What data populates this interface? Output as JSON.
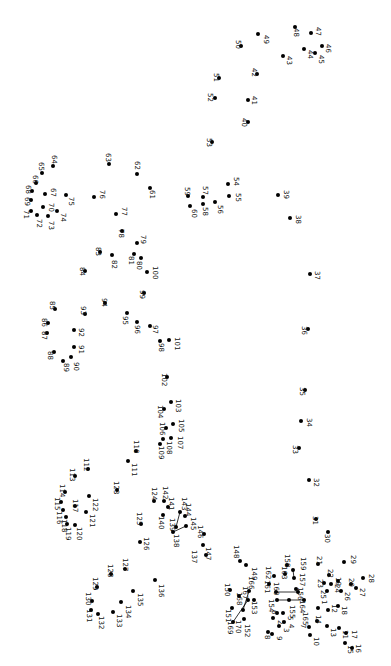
{
  "puzzle": {
    "type": "connect-the-dots",
    "orientation": "rotated-90-clockwise",
    "dot_color": "#000000",
    "label_color": "#111111",
    "background": "#ffffff",
    "total_points": 170,
    "points": [
      {
        "n": "1",
        "x": 318,
        "y": 608,
        "lx": 320,
        "ly": 600
      },
      {
        "n": "2",
        "x": 273,
        "y": 618,
        "lx": 276,
        "ly": 620
      },
      {
        "n": "3",
        "x": 279,
        "y": 626,
        "lx": 282,
        "ly": 628
      },
      {
        "n": "4",
        "x": 284,
        "y": 622,
        "lx": 287,
        "ly": 624
      },
      {
        "n": "5",
        "x": 283,
        "y": 613,
        "lx": 286,
        "ly": 616
      },
      {
        "n": "6",
        "x": 277,
        "y": 613,
        "lx": 270,
        "ly": 610
      },
      {
        "n": "7",
        "x": 309,
        "y": 627,
        "lx": 299,
        "ly": 624
      },
      {
        "n": "8",
        "x": 268,
        "y": 632,
        "lx": 263,
        "ly": 635
      },
      {
        "n": "9",
        "x": 272,
        "y": 634,
        "lx": 275,
        "ly": 636
      },
      {
        "n": "10",
        "x": 310,
        "y": 635,
        "lx": 312,
        "ly": 637
      },
      {
        "n": "11",
        "x": 339,
        "y": 628,
        "lx": 341,
        "ly": 630
      },
      {
        "n": "12",
        "x": 328,
        "y": 610,
        "lx": 330,
        "ly": 604
      },
      {
        "n": "13",
        "x": 327,
        "y": 626,
        "lx": 329,
        "ly": 628
      },
      {
        "n": "14",
        "x": 317,
        "y": 621,
        "lx": 314,
        "ly": 615
      },
      {
        "n": "15",
        "x": 345,
        "y": 643,
        "lx": 346,
        "ly": 645
      },
      {
        "n": "16",
        "x": 352,
        "y": 648,
        "lx": 354,
        "ly": 644
      },
      {
        "n": "17",
        "x": 346,
        "y": 633,
        "lx": 350,
        "ly": 630
      },
      {
        "n": "18",
        "x": 338,
        "y": 606,
        "lx": 340,
        "ly": 606
      },
      {
        "n": "19",
        "x": 338,
        "y": 581,
        "lx": 334,
        "ly": 577
      },
      {
        "n": "20",
        "x": 351,
        "y": 584,
        "lx": 347,
        "ly": 578
      },
      {
        "n": "21",
        "x": 318,
        "y": 564,
        "lx": 315,
        "ly": 556
      },
      {
        "n": "22",
        "x": 329,
        "y": 575,
        "lx": 326,
        "ly": 569
      },
      {
        "n": "23",
        "x": 324,
        "y": 583,
        "lx": 316,
        "ly": 579
      },
      {
        "n": "24",
        "x": 331,
        "y": 584,
        "lx": 333,
        "ly": 584
      },
      {
        "n": "25",
        "x": 327,
        "y": 591,
        "lx": 319,
        "ly": 590
      },
      {
        "n": "26",
        "x": 341,
        "y": 591,
        "lx": 343,
        "ly": 592
      },
      {
        "n": "27",
        "x": 356,
        "y": 588,
        "lx": 358,
        "ly": 588
      },
      {
        "n": "28",
        "x": 363,
        "y": 578,
        "lx": 367,
        "ly": 574
      },
      {
        "n": "29",
        "x": 344,
        "y": 562,
        "lx": 349,
        "ly": 555
      },
      {
        "n": "30",
        "x": 328,
        "y": 532,
        "lx": 323,
        "ly": 534
      },
      {
        "n": "31",
        "x": 316,
        "y": 519,
        "lx": 311,
        "ly": 516
      },
      {
        "n": "32",
        "x": 309,
        "y": 480,
        "lx": 312,
        "ly": 478
      },
      {
        "n": "33",
        "x": 299,
        "y": 448,
        "lx": 291,
        "ly": 445
      },
      {
        "n": "34",
        "x": 301,
        "y": 421,
        "lx": 305,
        "ly": 418
      },
      {
        "n": "35",
        "x": 305,
        "y": 390,
        "lx": 298,
        "ly": 387
      },
      {
        "n": "36",
        "x": 308,
        "y": 329,
        "lx": 300,
        "ly": 326
      },
      {
        "n": "37",
        "x": 310,
        "y": 274,
        "lx": 313,
        "ly": 271
      },
      {
        "n": "38",
        "x": 290,
        "y": 218,
        "lx": 294,
        "ly": 215
      },
      {
        "n": "39",
        "x": 278,
        "y": 195,
        "lx": 282,
        "ly": 190
      },
      {
        "n": "40",
        "x": 248,
        "y": 122,
        "lx": 240,
        "ly": 118
      },
      {
        "n": "41",
        "x": 248,
        "y": 100,
        "lx": 250,
        "ly": 96
      },
      {
        "n": "42",
        "x": 257,
        "y": 74,
        "lx": 250,
        "ly": 68
      },
      {
        "n": "43",
        "x": 283,
        "y": 56,
        "lx": 285,
        "ly": 56
      },
      {
        "n": "44",
        "x": 304,
        "y": 49,
        "lx": 306,
        "ly": 50
      },
      {
        "n": "45",
        "x": 315,
        "y": 53,
        "lx": 317,
        "ly": 55
      },
      {
        "n": "46",
        "x": 322,
        "y": 46,
        "lx": 324,
        "ly": 44
      },
      {
        "n": "47",
        "x": 311,
        "y": 33,
        "lx": 314,
        "ly": 27
      },
      {
        "n": "48",
        "x": 295,
        "y": 27,
        "lx": 292,
        "ly": 28
      },
      {
        "n": "49",
        "x": 258,
        "y": 34,
        "lx": 262,
        "ly": 35
      },
      {
        "n": "50",
        "x": 241,
        "y": 46,
        "lx": 234,
        "ly": 40
      },
      {
        "n": "51",
        "x": 219,
        "y": 78,
        "lx": 212,
        "ly": 73
      },
      {
        "n": "52",
        "x": 215,
        "y": 98,
        "lx": 206,
        "ly": 93
      },
      {
        "n": "53",
        "x": 212,
        "y": 142,
        "lx": 205,
        "ly": 138
      },
      {
        "n": "54",
        "x": 228,
        "y": 184,
        "lx": 232,
        "ly": 177
      },
      {
        "n": "55",
        "x": 229,
        "y": 196,
        "lx": 234,
        "ly": 193
      },
      {
        "n": "56",
        "x": 215,
        "y": 202,
        "lx": 216,
        "ly": 205
      },
      {
        "n": "57",
        "x": 203,
        "y": 197,
        "lx": 201,
        "ly": 186
      },
      {
        "n": "58",
        "x": 203,
        "y": 204,
        "lx": 201,
        "ly": 207
      },
      {
        "n": "59",
        "x": 188,
        "y": 196,
        "lx": 183,
        "ly": 187
      },
      {
        "n": "60",
        "x": 190,
        "y": 206,
        "lx": 190,
        "ly": 209
      },
      {
        "n": "61",
        "x": 150,
        "y": 188,
        "lx": 148,
        "ly": 190
      },
      {
        "n": "62",
        "x": 137,
        "y": 174,
        "lx": 133,
        "ly": 161
      },
      {
        "n": "63",
        "x": 109,
        "y": 164,
        "lx": 104,
        "ly": 153
      },
      {
        "n": "64",
        "x": 53,
        "y": 166,
        "lx": 50,
        "ly": 155
      },
      {
        "n": "65",
        "x": 42,
        "y": 173,
        "lx": 37,
        "ly": 162
      },
      {
        "n": "66",
        "x": 36,
        "y": 183,
        "lx": 31,
        "ly": 175
      },
      {
        "n": "67",
        "x": 45,
        "y": 194,
        "lx": 49,
        "ly": 188
      },
      {
        "n": "68",
        "x": 32,
        "y": 191,
        "lx": 24,
        "ly": 185
      },
      {
        "n": "69",
        "x": 31,
        "y": 200,
        "lx": 23,
        "ly": 197
      },
      {
        "n": "70",
        "x": 43,
        "y": 207,
        "lx": 47,
        "ly": 203
      },
      {
        "n": "71",
        "x": 31,
        "y": 211,
        "lx": 22,
        "ly": 210
      },
      {
        "n": "72",
        "x": 37,
        "y": 215,
        "lx": 35,
        "ly": 219
      },
      {
        "n": "73",
        "x": 48,
        "y": 216,
        "lx": 47,
        "ly": 221
      },
      {
        "n": "74",
        "x": 57,
        "y": 211,
        "lx": 59,
        "ly": 213
      },
      {
        "n": "75",
        "x": 66,
        "y": 195,
        "lx": 67,
        "ly": 197
      },
      {
        "n": "76",
        "x": 94,
        "y": 197,
        "lx": 98,
        "ly": 190
      },
      {
        "n": "77",
        "x": 116,
        "y": 214,
        "lx": 120,
        "ly": 207
      },
      {
        "n": "78",
        "x": 122,
        "y": 231,
        "lx": 117,
        "ly": 229
      },
      {
        "n": "79",
        "x": 137,
        "y": 243,
        "lx": 139,
        "ly": 235
      },
      {
        "n": "80",
        "x": 141,
        "y": 258,
        "lx": 135,
        "ly": 261
      },
      {
        "n": "81",
        "x": 134,
        "y": 254,
        "lx": 127,
        "ly": 256
      },
      {
        "n": "82",
        "x": 112,
        "y": 255,
        "lx": 110,
        "ly": 260
      },
      {
        "n": "83",
        "x": 100,
        "y": 252,
        "lx": 94,
        "ly": 247
      },
      {
        "n": "84",
        "x": 85,
        "y": 271,
        "lx": 78,
        "ly": 267
      },
      {
        "n": "85",
        "x": 55,
        "y": 309,
        "lx": 48,
        "ly": 301
      },
      {
        "n": "86",
        "x": 48,
        "y": 323,
        "lx": 40,
        "ly": 318
      },
      {
        "n": "87",
        "x": 47,
        "y": 333,
        "lx": 40,
        "ly": 331
      },
      {
        "n": "88",
        "x": 54,
        "y": 352,
        "lx": 46,
        "ly": 351
      },
      {
        "n": "89",
        "x": 63,
        "y": 361,
        "lx": 62,
        "ly": 363
      },
      {
        "n": "90",
        "x": 71,
        "y": 357,
        "lx": 72,
        "ly": 362
      },
      {
        "n": "91",
        "x": 74,
        "y": 347,
        "lx": 77,
        "ly": 345
      },
      {
        "n": "92",
        "x": 74,
        "y": 330,
        "lx": 77,
        "ly": 328
      },
      {
        "n": "93",
        "x": 85,
        "y": 314,
        "lx": 79,
        "ly": 306
      },
      {
        "n": "94",
        "x": 105,
        "y": 303,
        "lx": 100,
        "ly": 298
      },
      {
        "n": "95",
        "x": 127,
        "y": 313,
        "lx": 121,
        "ly": 316
      },
      {
        "n": "96",
        "x": 137,
        "y": 322,
        "lx": 133,
        "ly": 325
      },
      {
        "n": "97",
        "x": 150,
        "y": 326,
        "lx": 151,
        "ly": 325
      },
      {
        "n": "98",
        "x": 160,
        "y": 341,
        "lx": 157,
        "ly": 343
      },
      {
        "n": "99",
        "x": 144,
        "y": 293,
        "lx": 138,
        "ly": 290
      },
      {
        "n": "100",
        "x": 147,
        "y": 272,
        "lx": 151,
        "ly": 266
      },
      {
        "n": "101",
        "x": 169,
        "y": 340,
        "lx": 173,
        "ly": 337
      },
      {
        "n": "102",
        "x": 167,
        "y": 377,
        "lx": 160,
        "ly": 373
      },
      {
        "n": "103",
        "x": 171,
        "y": 402,
        "lx": 174,
        "ly": 399
      },
      {
        "n": "104",
        "x": 164,
        "y": 409,
        "lx": 156,
        "ly": 405
      },
      {
        "n": "105",
        "x": 173,
        "y": 424,
        "lx": 177,
        "ly": 419
      },
      {
        "n": "106",
        "x": 166,
        "y": 428,
        "lx": 158,
        "ly": 422
      },
      {
        "n": "107",
        "x": 171,
        "y": 438,
        "lx": 176,
        "ly": 436
      },
      {
        "n": "108",
        "x": 163,
        "y": 439,
        "lx": 165,
        "ly": 441
      },
      {
        "n": "109",
        "x": 160,
        "y": 444,
        "lx": 157,
        "ly": 446
      },
      {
        "n": "110",
        "x": 136,
        "y": 451,
        "lx": 132,
        "ly": 440
      },
      {
        "n": "111",
        "x": 128,
        "y": 461,
        "lx": 130,
        "ly": 463
      },
      {
        "n": "112",
        "x": 88,
        "y": 469,
        "lx": 82,
        "ly": 458
      },
      {
        "n": "113",
        "x": 75,
        "y": 476,
        "lx": 68,
        "ly": 468
      },
      {
        "n": "114",
        "x": 65,
        "y": 492,
        "lx": 58,
        "ly": 484
      },
      {
        "n": "115",
        "x": 61,
        "y": 502,
        "lx": 53,
        "ly": 497
      },
      {
        "n": "116",
        "x": 63,
        "y": 510,
        "lx": 55,
        "ly": 511
      },
      {
        "n": "117",
        "x": 75,
        "y": 506,
        "lx": 71,
        "ly": 499
      },
      {
        "n": "118",
        "x": 66,
        "y": 517,
        "lx": 60,
        "ly": 519
      },
      {
        "n": "119",
        "x": 67,
        "y": 524,
        "lx": 64,
        "ly": 527
      },
      {
        "n": "120",
        "x": 75,
        "y": 525,
        "lx": 75,
        "ly": 527
      },
      {
        "n": "121",
        "x": 86,
        "y": 512,
        "lx": 88,
        "ly": 514
      },
      {
        "n": "122",
        "x": 89,
        "y": 496,
        "lx": 91,
        "ly": 498
      },
      {
        "n": "123",
        "x": 117,
        "y": 490,
        "lx": 112,
        "ly": 481
      },
      {
        "n": "124",
        "x": 154,
        "y": 501,
        "lx": 150,
        "ly": 487
      },
      {
        "n": "125",
        "x": 141,
        "y": 524,
        "lx": 135,
        "ly": 512
      },
      {
        "n": "126",
        "x": 140,
        "y": 542,
        "lx": 142,
        "ly": 537
      },
      {
        "n": "127",
        "x": 125,
        "y": 569,
        "lx": 121,
        "ly": 558
      },
      {
        "n": "128",
        "x": 111,
        "y": 574,
        "lx": 106,
        "ly": 564
      },
      {
        "n": "129",
        "x": 97,
        "y": 587,
        "lx": 91,
        "ly": 577
      },
      {
        "n": "130",
        "x": 92,
        "y": 601,
        "lx": 84,
        "ly": 592
      },
      {
        "n": "131",
        "x": 91,
        "y": 610,
        "lx": 85,
        "ly": 609
      },
      {
        "n": "132",
        "x": 98,
        "y": 614,
        "lx": 97,
        "ly": 616
      },
      {
        "n": "133",
        "x": 113,
        "y": 612,
        "lx": 115,
        "ly": 614
      },
      {
        "n": "134",
        "x": 121,
        "y": 602,
        "lx": 124,
        "ly": 605
      },
      {
        "n": "135",
        "x": 133,
        "y": 591,
        "lx": 136,
        "ly": 593
      },
      {
        "n": "136",
        "x": 155,
        "y": 580,
        "lx": 157,
        "ly": 584
      },
      {
        "n": "137",
        "x": 203,
        "y": 545,
        "lx": 190,
        "ly": 550
      },
      {
        "n": "138",
        "x": 173,
        "y": 532,
        "lx": 172,
        "ly": 534
      },
      {
        "n": "139",
        "x": 176,
        "y": 527,
        "lx": 168,
        "ly": 518
      },
      {
        "n": "140",
        "x": 163,
        "y": 515,
        "lx": 157,
        "ly": 516
      },
      {
        "n": "141",
        "x": 168,
        "y": 507,
        "lx": 167,
        "ly": 497
      },
      {
        "n": "142",
        "x": 164,
        "y": 501,
        "lx": 161,
        "ly": 486
      },
      {
        "n": "143",
        "x": 180,
        "y": 512,
        "lx": 180,
        "ly": 497
      },
      {
        "n": "144",
        "x": 185,
        "y": 516,
        "lx": 184,
        "ly": 503
      },
      {
        "n": "145",
        "x": 186,
        "y": 526,
        "lx": 189,
        "ly": 517
      },
      {
        "n": "146",
        "x": 204,
        "y": 534,
        "lx": 196,
        "ly": 525
      },
      {
        "n": "147",
        "x": 206,
        "y": 555,
        "lx": 204,
        "ly": 547
      },
      {
        "n": "148",
        "x": 240,
        "y": 561,
        "lx": 232,
        "ly": 545
      },
      {
        "n": "149",
        "x": 246,
        "y": 565,
        "lx": 250,
        "ly": 567
      },
      {
        "n": "150",
        "x": 230,
        "y": 590,
        "lx": 223,
        "ly": 583
      },
      {
        "n": "151",
        "x": 232,
        "y": 608,
        "lx": 224,
        "ly": 609
      },
      {
        "n": "152",
        "x": 244,
        "y": 619,
        "lx": 243,
        "ly": 624
      },
      {
        "n": "153",
        "x": 254,
        "y": 600,
        "lx": 250,
        "ly": 601
      },
      {
        "n": "154",
        "x": 277,
        "y": 600,
        "lx": 267,
        "ly": 599
      },
      {
        "n": "155",
        "x": 289,
        "y": 600,
        "lx": 288,
        "ly": 605
      },
      {
        "n": "156",
        "x": 296,
        "y": 589,
        "lx": 296,
        "ly": 587
      },
      {
        "n": "157",
        "x": 294,
        "y": 578,
        "lx": 298,
        "ly": 573
      },
      {
        "n": "158",
        "x": 287,
        "y": 565,
        "lx": 283,
        "ly": 554
      },
      {
        "n": "159",
        "x": 293,
        "y": 570,
        "lx": 299,
        "ly": 557
      },
      {
        "n": "160",
        "x": 276,
        "y": 592,
        "lx": 272,
        "ly": 582
      },
      {
        "n": "161",
        "x": 269,
        "y": 584,
        "lx": 263,
        "ly": 580
      },
      {
        "n": "162",
        "x": 274,
        "y": 576,
        "lx": 264,
        "ly": 566
      },
      {
        "n": "163",
        "x": 285,
        "y": 574,
        "lx": 280,
        "ly": 566
      },
      {
        "n": "164",
        "x": 298,
        "y": 592,
        "lx": 298,
        "ly": 600
      },
      {
        "n": "165",
        "x": 304,
        "y": 600,
        "lx": 301,
        "ly": 612
      },
      {
        "n": "166",
        "x": 249,
        "y": 591,
        "lx": 247,
        "ly": 576
      },
      {
        "n": "167",
        "x": 248,
        "y": 600,
        "lx": 241,
        "ly": 586
      },
      {
        "n": "168",
        "x": 239,
        "y": 596,
        "lx": 235,
        "ly": 592
      },
      {
        "n": "169",
        "x": 233,
        "y": 622,
        "lx": 226,
        "ly": 621
      },
      {
        "n": "170",
        "x": 243,
        "y": 610,
        "lx": 234,
        "ly": 620
      }
    ],
    "drawn_segments": [
      {
        "from": "159",
        "to": "157"
      },
      {
        "from": "160",
        "to": "164"
      },
      {
        "from": "154",
        "to": "165"
      },
      {
        "from": "143",
        "to": "139"
      },
      {
        "from": "145",
        "to": "138"
      },
      {
        "from": "167",
        "to": "169"
      },
      {
        "from": "166",
        "to": "170"
      }
    ]
  }
}
